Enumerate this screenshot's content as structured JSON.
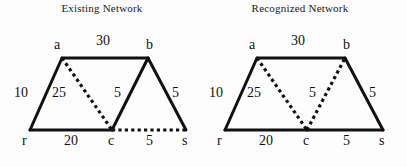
{
  "figure": {
    "background_color": "#fdfdfd",
    "stroke_color": "#111111",
    "panels": [
      {
        "id": "existing",
        "title": "Existing Network",
        "nodes": [
          {
            "id": "a",
            "label": "a",
            "x": 62,
            "y": 58,
            "label_x": 54,
            "label_y": 38
          },
          {
            "id": "b",
            "label": "b",
            "x": 148,
            "y": 58,
            "label_x": 146,
            "label_y": 38
          },
          {
            "id": "r",
            "label": "r",
            "x": 30,
            "y": 130,
            "label_x": 22,
            "label_y": 134
          },
          {
            "id": "c",
            "label": "c",
            "x": 112,
            "y": 130,
            "label_x": 108,
            "label_y": 134
          },
          {
            "id": "s",
            "label": "s",
            "x": 186,
            "y": 130,
            "label_x": 182,
            "label_y": 134
          }
        ],
        "edges": [
          {
            "from": "a",
            "to": "b",
            "style": "solid",
            "weight": "30",
            "label_x": 96,
            "label_y": 34
          },
          {
            "from": "r",
            "to": "a",
            "style": "solid",
            "weight": "10",
            "label_x": 14,
            "label_y": 86
          },
          {
            "from": "a",
            "to": "c",
            "style": "dotted",
            "weight": "25",
            "label_x": 52,
            "label_y": 86
          },
          {
            "from": "c",
            "to": "b",
            "style": "solid",
            "weight": "5",
            "label_x": 114,
            "label_y": 86
          },
          {
            "from": "b",
            "to": "s",
            "style": "solid",
            "weight": "5",
            "label_x": 172,
            "label_y": 86
          },
          {
            "from": "r",
            "to": "c",
            "style": "solid",
            "weight": "20",
            "label_x": 64,
            "label_y": 134
          },
          {
            "from": "c",
            "to": "s",
            "style": "dotted",
            "weight": "5",
            "label_x": 146,
            "label_y": 134
          }
        ]
      },
      {
        "id": "recognized",
        "title": "Recognized Network",
        "nodes": [
          {
            "id": "a",
            "label": "a",
            "x": 62,
            "y": 58,
            "label_x": 54,
            "label_y": 38
          },
          {
            "id": "b",
            "label": "b",
            "x": 150,
            "y": 58,
            "label_x": 148,
            "label_y": 38
          },
          {
            "id": "r",
            "label": "r",
            "x": 30,
            "y": 130,
            "label_x": 22,
            "label_y": 134
          },
          {
            "id": "c",
            "label": "c",
            "x": 112,
            "y": 130,
            "label_x": 108,
            "label_y": 134
          },
          {
            "id": "s",
            "label": "s",
            "x": 188,
            "y": 130,
            "label_x": 184,
            "label_y": 134
          }
        ],
        "edges": [
          {
            "from": "a",
            "to": "b",
            "style": "solid",
            "weight": "30",
            "label_x": 96,
            "label_y": 34
          },
          {
            "from": "r",
            "to": "a",
            "style": "solid",
            "weight": "10",
            "label_x": 14,
            "label_y": 86
          },
          {
            "from": "a",
            "to": "c",
            "style": "dotted",
            "weight": "25",
            "label_x": 52,
            "label_y": 86
          },
          {
            "from": "c",
            "to": "b",
            "style": "dotted",
            "weight": "5",
            "label_x": 114,
            "label_y": 86
          },
          {
            "from": "b",
            "to": "s",
            "style": "solid",
            "weight": "5",
            "label_x": 174,
            "label_y": 86
          },
          {
            "from": "r",
            "to": "c",
            "style": "solid",
            "weight": "20",
            "label_x": 64,
            "label_y": 134
          },
          {
            "from": "c",
            "to": "s",
            "style": "solid",
            "weight": "5",
            "label_x": 148,
            "label_y": 134
          }
        ]
      }
    ]
  }
}
